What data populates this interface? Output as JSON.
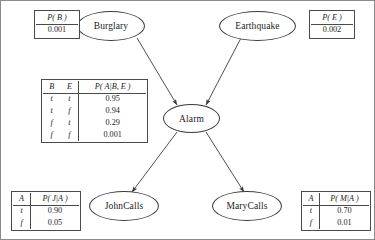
{
  "diagram": {
    "nodes": [
      {
        "id": "burglary",
        "label": "Burglary"
      },
      {
        "id": "earthquake",
        "label": "Earthquake"
      },
      {
        "id": "alarm",
        "label": "Alarm"
      },
      {
        "id": "johncalls",
        "label": "JohnCalls"
      },
      {
        "id": "marycalls",
        "label": "MaryCalls"
      }
    ],
    "edges": [
      {
        "from": "Burglary",
        "to": "Alarm"
      },
      {
        "from": "Earthquake",
        "to": "Alarm"
      },
      {
        "from": "Alarm",
        "to": "JohnCalls"
      },
      {
        "from": "Alarm",
        "to": "MaryCalls"
      }
    ],
    "colors": {
      "stroke": "#3a3a3a",
      "table_border": "#4a4a4a",
      "background": "#ffffff",
      "text": "#1c1c1c"
    }
  },
  "tables": {
    "burglary_prior": {
      "header": [
        "P( B )"
      ],
      "rows": [
        [
          "0.001"
        ]
      ]
    },
    "earthquake_prior": {
      "header": [
        "P( E )"
      ],
      "rows": [
        [
          "0.002"
        ]
      ]
    },
    "alarm_cpt": {
      "header": [
        "B",
        "E",
        "P( A|B, E )"
      ],
      "rows": [
        [
          "t",
          "t",
          "0.95"
        ],
        [
          "t",
          "f",
          "0.94"
        ],
        [
          "f",
          "t",
          "0.29"
        ],
        [
          "f",
          "f",
          "0.001"
        ]
      ]
    },
    "johncalls_cpt": {
      "header": [
        "A",
        "P( J|A )"
      ],
      "rows": [
        [
          "t",
          "0.90"
        ],
        [
          "f",
          "0.05"
        ]
      ]
    },
    "marycalls_cpt": {
      "header": [
        "A",
        "P( M|A )"
      ],
      "rows": [
        [
          "t",
          "0.70"
        ],
        [
          "f",
          "0.01"
        ]
      ]
    }
  }
}
